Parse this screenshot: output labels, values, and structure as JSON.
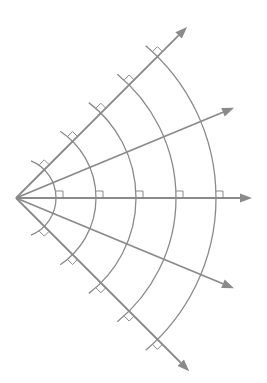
{
  "diagram": {
    "origin": [
      16,
      198
    ],
    "stroke_color": "#8a8a8a",
    "rays": [
      {
        "name": "ray-up-45",
        "angle_deg": 45,
        "length": 242,
        "marked": true
      },
      {
        "name": "ray-up-22",
        "angle_deg": 22.5,
        "length": 236,
        "marked": false
      },
      {
        "name": "ray-horizontal",
        "angle_deg": 0,
        "length": 236,
        "marked": true
      },
      {
        "name": "ray-down-22",
        "angle_deg": -22.5,
        "length": 236,
        "marked": false
      },
      {
        "name": "ray-down-45",
        "angle_deg": -45,
        "length": 245,
        "marked": true
      }
    ],
    "arcs": [
      {
        "radius": 40
      },
      {
        "radius": 80
      },
      {
        "radius": 120
      },
      {
        "radius": 160
      },
      {
        "radius": 200
      }
    ],
    "arc_overshoot_px": 16,
    "right_angle_marker_size": 7
  }
}
